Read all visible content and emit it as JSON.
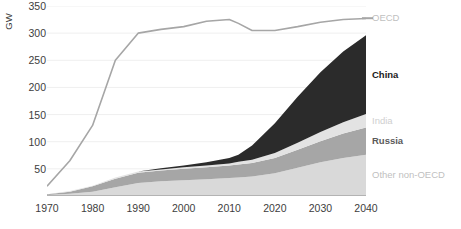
{
  "chart_data": {
    "type": "area",
    "title": "",
    "xlabel": "",
    "ylabel": "GW",
    "x": [
      1970,
      1975,
      1980,
      1985,
      1990,
      1995,
      2000,
      2005,
      2010,
      2012,
      2015,
      2020,
      2025,
      2030,
      2035,
      2040
    ],
    "xlim": [
      1970,
      2040
    ],
    "ylim": [
      0,
      350
    ],
    "xticks": [
      "1970",
      "1980",
      "1990",
      "2000",
      "2010",
      "2020",
      "2030",
      "2040"
    ],
    "yticks": [
      "50",
      "100",
      "150",
      "200",
      "250",
      "300",
      "350"
    ],
    "grid": true,
    "legend_position": "right",
    "stacked": true,
    "stack_order_bottom_to_top": [
      "Other non-OECD",
      "Russia",
      "India",
      "China"
    ],
    "series": [
      {
        "name": "Other non-OECD",
        "kind": "area",
        "color": "#d9d9d9",
        "label_color": "#bfbfbf",
        "bold": false,
        "values": [
          2,
          4,
          8,
          16,
          24,
          27,
          29,
          31,
          33,
          34,
          36,
          42,
          52,
          62,
          70,
          76
        ]
      },
      {
        "name": "Russia",
        "kind": "area",
        "color": "#a6a6a6",
        "label_color": "#5a5a5a",
        "bold": true,
        "values": [
          1,
          4,
          10,
          16,
          19,
          20,
          21,
          22,
          23,
          24,
          25,
          28,
          33,
          39,
          45,
          50
        ]
      },
      {
        "name": "India",
        "kind": "area",
        "color": "#e3e3e3",
        "label_color": "#cfcfcf",
        "bold": false,
        "values": [
          0,
          1,
          1,
          2,
          2,
          2,
          3,
          3,
          4,
          5,
          6,
          9,
          13,
          17,
          21,
          25
        ]
      },
      {
        "name": "China",
        "kind": "area",
        "color": "#2b2b2b",
        "label_color": "#1a1a1a",
        "bold": true,
        "values": [
          0,
          0,
          0,
          0,
          0,
          2,
          3,
          6,
          10,
          13,
          26,
          55,
          85,
          110,
          130,
          145
        ]
      },
      {
        "name": "OECD",
        "kind": "line",
        "color": "#a6a6a6",
        "label_color": "#bfbfbf",
        "bold": false,
        "values": [
          18,
          65,
          130,
          250,
          300,
          307,
          312,
          322,
          325,
          318,
          305,
          305,
          312,
          320,
          325,
          327
        ]
      }
    ],
    "annotations": []
  },
  "legend": {
    "items": [
      {
        "label": "OECD",
        "marker": "line"
      },
      {
        "label": "China",
        "marker": "none"
      },
      {
        "label": "India",
        "marker": "none"
      },
      {
        "label": "Russia",
        "marker": "none"
      },
      {
        "label": "Other non-OECD",
        "marker": "none"
      }
    ]
  },
  "axes": {
    "y_title": "GW"
  }
}
